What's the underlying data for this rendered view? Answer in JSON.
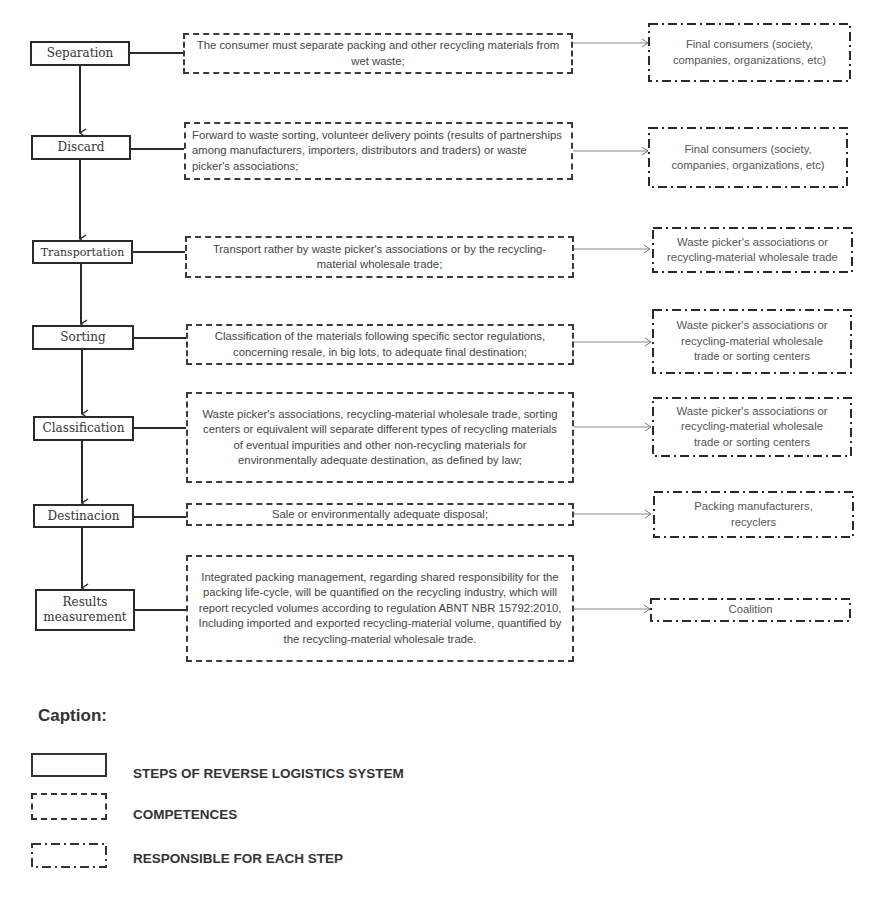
{
  "diagram": {
    "steps": [
      {
        "label": "Separation"
      },
      {
        "label": "Discard"
      },
      {
        "label": "Transportation"
      },
      {
        "label": "Sorting"
      },
      {
        "label": "Classification"
      },
      {
        "label": "Destinacion"
      },
      {
        "label_line1": "Results",
        "label_line2": "measurement"
      }
    ],
    "competences": [
      {
        "text": "The consumer must separate packing and other recycling materials from wet waste;"
      },
      {
        "text": "Forward to waste sorting, volunteer delivery points (results of partnerships among manufacturers, importers, distributors and traders) or waste picker's associations;"
      },
      {
        "text": "Transport rather by waste picker's associations or by the recycling-material wholesale trade;"
      },
      {
        "text": "Classification of the materials following specific sector regulations, concerning resale, in big lots, to adequate final destination;"
      },
      {
        "text": "Waste picker's associations, recycling-material wholesale trade, sorting centers or equivalent will separate different types of recycling materials of eventual impurities and other non-recycling materials for environmentally adequate destination, as defined by law;"
      },
      {
        "text": "Sale or environmentally adequate disposal;"
      },
      {
        "text": "Integrated packing management, regarding shared responsibility for the packing life-cycle, will be quantified on the recycling industry, which will report recycled volumes according to regulation ABNT NBR 15792:2010, Including imported and exported recycling-material volume, quantified by the recycling-material wholesale trade."
      }
    ],
    "responsibles": [
      {
        "text": "Final consumers (society, companies, organizations, etc)"
      },
      {
        "text": "Final consumers (society, companies, organizations, etc)"
      },
      {
        "text": "Waste picker's associations or recycling-material wholesale trade"
      },
      {
        "text": "Waste picker's associations or recycling-material wholesale trade or sorting centers"
      },
      {
        "text": "Waste picker's associations or recycling-material wholesale trade or sorting centers"
      },
      {
        "text": "Packing manufacturers, recyclers"
      },
      {
        "text": "Coalition"
      }
    ]
  },
  "legend": {
    "title": "Caption:",
    "items": [
      {
        "style": "solid",
        "label": "STEPS OF REVERSE LOGISTICS SYSTEM"
      },
      {
        "style": "dashed",
        "label": "COMPETENCES"
      },
      {
        "style": "dash-dot",
        "label": "RESPONSIBLE FOR EACH STEP"
      }
    ]
  },
  "colors": {
    "line": "#2a2a2a",
    "connector": "#888888",
    "background": "#ffffff"
  }
}
